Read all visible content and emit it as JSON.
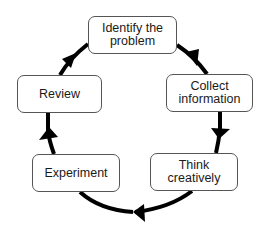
{
  "diagram": {
    "type": "cycle",
    "direction": "clockwise",
    "colors": {
      "arrow": "#000000",
      "box_border": "#555555",
      "text": "#1a1a1a",
      "background": "#ffffff"
    },
    "nodes": [
      {
        "id": "identify",
        "label": "Identify the\nproblem"
      },
      {
        "id": "collect",
        "label": "Collect\ninformation"
      },
      {
        "id": "think",
        "label": "Think\ncreatively"
      },
      {
        "id": "experiment",
        "label": "Experiment"
      },
      {
        "id": "review",
        "label": "Review"
      }
    ],
    "edges": [
      {
        "from": "identify",
        "to": "collect",
        "icon": "arrow-head-icon"
      },
      {
        "from": "collect",
        "to": "think",
        "icon": "arrow-head-icon"
      },
      {
        "from": "think",
        "to": "experiment",
        "icon": "arrow-head-icon"
      },
      {
        "from": "experiment",
        "to": "review",
        "icon": "arrow-head-icon"
      },
      {
        "from": "review",
        "to": "identify",
        "icon": "arrow-head-icon"
      }
    ]
  }
}
